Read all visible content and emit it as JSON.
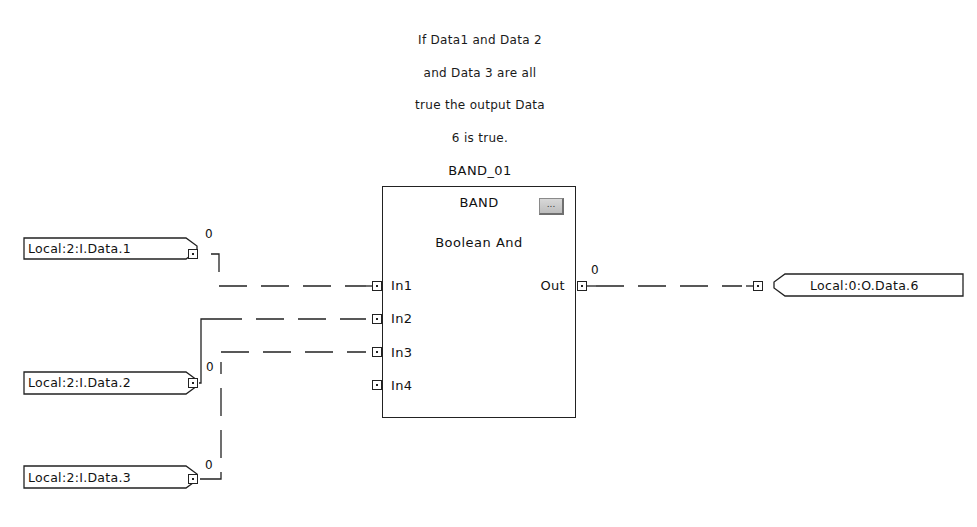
{
  "comment": {
    "lines": [
      "If Data1 and Data 2",
      "and Data 3 are all",
      "true the output Data",
      "6 is true."
    ]
  },
  "block": {
    "tag": "BAND_01",
    "type": "BAND",
    "description": "Boolean And",
    "props_button": "...",
    "inputs": [
      "In1",
      "In2",
      "In3",
      "In4"
    ],
    "output": "Out",
    "output_value": "0"
  },
  "input_references": [
    {
      "tag": "Local:2:I.Data.1",
      "value": "0",
      "connected_pin": "In1"
    },
    {
      "tag": "Local:2:I.Data.2",
      "value": "0",
      "connected_pin": "In2"
    },
    {
      "tag": "Local:2:I.Data.3",
      "value": "0",
      "connected_pin": "In3"
    }
  ],
  "output_references": [
    {
      "tag": "Local:0:O.Data.6",
      "connected_pin": "Out"
    }
  ],
  "colors": {
    "line": "#222222",
    "background": "#ffffff",
    "button": "#c8c8c8"
  }
}
